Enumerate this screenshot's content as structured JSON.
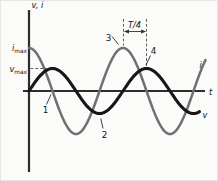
{
  "figure": {
    "background": "#fbfbfa",
    "axis_color": "#2d2d2d",
    "labels": {
      "y_axis": "v, i",
      "x_axis": "t",
      "i_max_symbol": "i",
      "i_max_subscript": "max",
      "v_max_symbol": "v",
      "v_max_subscript": "max",
      "quarter_period": "T/4",
      "current_curve_end": "i",
      "voltage_curve_end": "v",
      "point_1": "1",
      "point_2": "2",
      "point_3": "3",
      "point_4": "4"
    }
  },
  "chart_data": {
    "type": "line",
    "title": "",
    "xlabel": "t",
    "ylabel": "v, i",
    "x_range_periods": [
      0,
      1.88
    ],
    "grid": false,
    "legend": "curve-end labels i and v at right edge",
    "series": [
      {
        "name": "i",
        "end_label": "i",
        "color": "#707070",
        "amplitude_label": "i_max",
        "waveform": "i = i_max cos(2*pi*t/T)",
        "phase_deg": 90,
        "relative_amplitude": 1.0
      },
      {
        "name": "v",
        "end_label": "v",
        "color": "#171717",
        "amplitude_label": "v_max",
        "waveform": "v = v_max sin(2*pi*t/T)",
        "phase_deg": 0,
        "relative_amplitude": 0.52
      }
    ],
    "phase_relationship": "current i leads voltage v by T/4 (90 degrees)",
    "interval_marker": {
      "label": "T/4",
      "from_x_periods": 1.0,
      "to_x_periods": 1.25,
      "from_feature": "peak of i (point 3)",
      "to_feature": "peak of v (point 4)"
    },
    "marked_points": [
      {
        "label": "1",
        "feature": "descending zero crossing of i at t = T/4"
      },
      {
        "label": "2",
        "feature": "trough of v at t = 3T/4"
      },
      {
        "label": "3",
        "feature": "peak of i at t = T"
      },
      {
        "label": "4",
        "feature": "peak of v at t = 5T/4"
      }
    ],
    "geometry_px": {
      "origin_x": 29,
      "origin_y": 91,
      "period": 94,
      "amp_i": 43,
      "amp_v": 22.5,
      "x_start": 29,
      "x_end_i": 205.5,
      "x_end_v": 199.5
    }
  }
}
